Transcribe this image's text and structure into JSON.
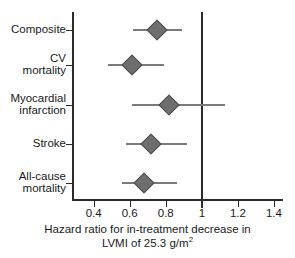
{
  "chart_data": {
    "type": "scatter",
    "subtype": "forest-plot",
    "title": "",
    "xlabel_line1": "Hazard ratio for in-treatment decrease in",
    "xlabel_line2_pre": "LVMI of 25.3 g/m",
    "xlabel_line2_sup": "2",
    "ylabel": "",
    "xlim": [
      0.28,
      1.45
    ],
    "xticks": [
      0.4,
      0.6,
      0.8,
      1.0,
      1.2,
      1.4
    ],
    "xticklabels": [
      "0.4",
      "0.6",
      "0.8",
      "1",
      "1.2",
      "1.4"
    ],
    "reference_line": 1.0,
    "grid": false,
    "legend": "none",
    "marker": "diamond",
    "marker_color": "#6e6e6e",
    "ci_color": "#7a7a7a",
    "axis_color": "#2b2b2b",
    "categories": [
      "Composite",
      "CV\nmortality",
      "Myocardial\ninfarction",
      "Stroke",
      "All-cause\nmortality"
    ],
    "points": [
      {
        "label": "Composite",
        "hr": 0.75,
        "ci_low": 0.62,
        "ci_high": 0.89
      },
      {
        "label": "CV mortality",
        "hr": 0.61,
        "ci_low": 0.48,
        "ci_high": 0.79
      },
      {
        "label": "Myocardial infarction",
        "hr": 0.82,
        "ci_low": 0.61,
        "ci_high": 1.13
      },
      {
        "label": "Stroke",
        "hr": 0.72,
        "ci_low": 0.58,
        "ci_high": 0.92
      },
      {
        "label": "All-cause mortality",
        "hr": 0.68,
        "ci_low": 0.56,
        "ci_high": 0.86
      }
    ]
  }
}
